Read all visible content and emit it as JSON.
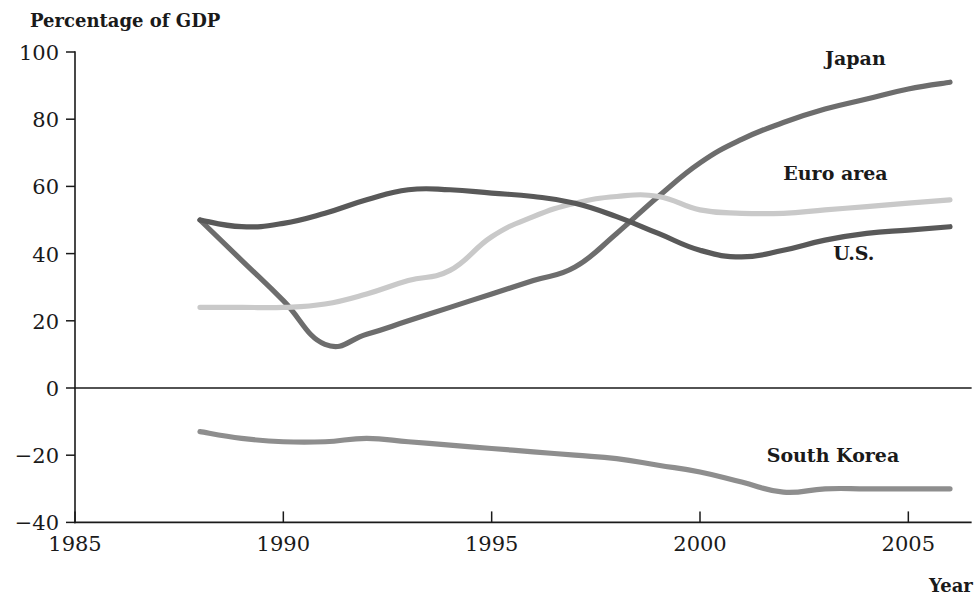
{
  "chart_data": {
    "type": "line",
    "title": "",
    "ylabel": "Percentage of GDP",
    "xlabel": "Year",
    "xlim": [
      1985,
      2006.5
    ],
    "ylim": [
      -40,
      100
    ],
    "xticks": [
      1985,
      1990,
      1995,
      2000,
      2005
    ],
    "yticks": [
      100,
      80,
      60,
      40,
      20,
      0,
      -20,
      -40
    ],
    "xtick_labels": [
      "1985",
      "1990",
      "1995",
      "2000",
      "2005"
    ],
    "ytick_labels": [
      "100",
      "80",
      "60",
      "40",
      "20",
      "0",
      "−20",
      "−40"
    ],
    "grid": false,
    "legend_position": "inline-right-annotations",
    "zero_line": true,
    "series": [
      {
        "name": "Japan",
        "color": "#6d6d6d",
        "label": "Japan",
        "label_x": 2003.0,
        "label_y": 96,
        "x": [
          1988,
          1989,
          1990,
          1991,
          1992,
          1993,
          1994,
          1995,
          1996,
          1997,
          1998,
          1999,
          2000,
          2001,
          2002,
          2003,
          2004,
          2005,
          2006
        ],
        "y": [
          50,
          38,
          26,
          13,
          16,
          20,
          24,
          28,
          32,
          36,
          46,
          57,
          67,
          74,
          79,
          83,
          86,
          89,
          91
        ]
      },
      {
        "name": "Euro area",
        "color": "#c9c9c9",
        "label": "Euro area",
        "label_x": 2002.0,
        "label_y": 62,
        "x": [
          1988,
          1989,
          1990,
          1991,
          1992,
          1993,
          1994,
          1995,
          1996,
          1997,
          1998,
          1999,
          2000,
          2001,
          2002,
          2003,
          2004,
          2005,
          2006
        ],
        "y": [
          24,
          24,
          24,
          25,
          28,
          32,
          35,
          45,
          51,
          55,
          57,
          57,
          53,
          52,
          52,
          53,
          54,
          55,
          56
        ]
      },
      {
        "name": "U.S.",
        "color": "#595959",
        "label": "U.S.",
        "label_x": 2003.2,
        "label_y": 38,
        "x": [
          1988,
          1989,
          1990,
          1991,
          1992,
          1993,
          1994,
          1995,
          1996,
          1997,
          1998,
          1999,
          2000,
          2001,
          2002,
          2003,
          2004,
          2005,
          2006
        ],
        "y": [
          50,
          48,
          49,
          52,
          56,
          59,
          59,
          58,
          57,
          55,
          51,
          46,
          41,
          39,
          41,
          44,
          46,
          47,
          48
        ]
      },
      {
        "name": "South Korea",
        "color": "#8e8e8e",
        "label": "South Korea",
        "label_x": 2001.6,
        "label_y": -22,
        "x": [
          1988,
          1989,
          1990,
          1991,
          1992,
          1993,
          1994,
          1995,
          1996,
          1997,
          1998,
          1999,
          2000,
          2001,
          2002,
          2003,
          2004,
          2005,
          2006
        ],
        "y": [
          -13,
          -15,
          -16,
          -16,
          -15,
          -16,
          -17,
          -18,
          -19,
          -20,
          -21,
          -23,
          -25,
          -28,
          -31,
          -30,
          -30,
          -30,
          -30
        ]
      }
    ]
  }
}
